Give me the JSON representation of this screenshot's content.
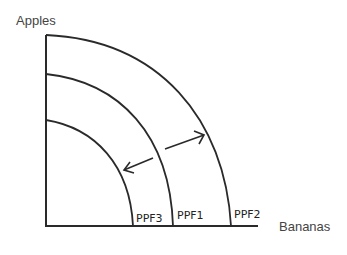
{
  "diagram": {
    "y_axis_label": "Apples",
    "x_axis_label": "Bananas",
    "curves": [
      {
        "label": "PPF3",
        "position": "inner"
      },
      {
        "label": "PPF1",
        "position": "middle"
      },
      {
        "label": "PPF2",
        "position": "outer"
      }
    ],
    "arrows": [
      {
        "direction": "outward",
        "from": "PPF1",
        "to": "PPF2"
      },
      {
        "direction": "inward",
        "from": "PPF1",
        "to": "PPF3"
      }
    ],
    "colors": {
      "line": "#2a2a2a",
      "text": "#444444"
    }
  }
}
